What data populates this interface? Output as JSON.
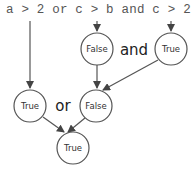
{
  "expression": "a > 2 or c > b and c > 2",
  "nodes": {
    "false_top": {
      "label": "False"
    },
    "true_top": {
      "label": "True"
    },
    "true_left": {
      "label": "True"
    },
    "false_mid": {
      "label": "False"
    },
    "true_bottom": {
      "label": "True"
    }
  },
  "operators": {
    "and": "and",
    "or": "or"
  },
  "colors": {
    "stroke": "#555555",
    "text": "#333333"
  }
}
